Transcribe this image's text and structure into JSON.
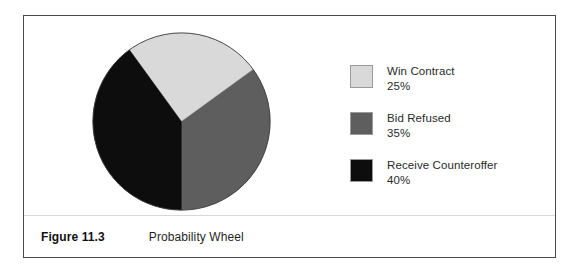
{
  "figure": {
    "caption_number": "Figure 11.3",
    "caption_title": "Probability Wheel"
  },
  "legend": {
    "items": [
      {
        "label": "Win Contract",
        "value": "25%",
        "color": "#d9d9d9"
      },
      {
        "label": "Bid Refused",
        "value": "35%",
        "color": "#5e5e5e"
      },
      {
        "label": "Receive Counteroffer",
        "value": "40%",
        "color": "#0d0d0d"
      }
    ]
  },
  "chart_data": {
    "type": "pie",
    "title": "Probability Wheel",
    "categories": [
      "Win Contract",
      "Bid Refused",
      "Receive Counteroffer"
    ],
    "values": [
      25,
      35,
      40
    ],
    "value_labels": [
      "25%",
      "35%",
      "40%"
    ],
    "colors": [
      "#d9d9d9",
      "#5e5e5e",
      "#0d0d0d"
    ],
    "units": "percent",
    "total": 100,
    "start_angle_deg": -126,
    "direction": "clockwise",
    "legend_position": "right",
    "grid": false,
    "xlabel": "",
    "ylabel": ""
  }
}
